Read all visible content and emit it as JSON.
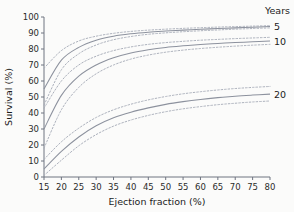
{
  "chart_data": {
    "type": "line",
    "title": "",
    "xlabel": "Ejection fraction (%)",
    "ylabel": "Survival (%)",
    "xlim": [
      15,
      80
    ],
    "ylim": [
      0,
      100
    ],
    "grid": false,
    "legend_position": "right",
    "legend_title": "Years",
    "xticks": [
      15,
      20,
      25,
      30,
      35,
      40,
      45,
      50,
      55,
      60,
      65,
      70,
      75,
      80
    ],
    "yticks": [
      0,
      10,
      20,
      30,
      40,
      50,
      60,
      70,
      80,
      90,
      100
    ],
    "x": [
      15,
      20,
      25,
      30,
      35,
      40,
      45,
      50,
      55,
      60,
      65,
      70,
      75,
      80
    ],
    "series": [
      {
        "name": "5",
        "label": "5",
        "style": "solid",
        "values": [
          55,
          73,
          81,
          85.5,
          88,
          89.5,
          90.5,
          91.2,
          91.8,
          92.3,
          92.8,
          93.2,
          93.6,
          94
        ],
        "ci_upper": [
          68,
          79,
          85,
          88,
          89.8,
          91,
          91.8,
          92.4,
          92.9,
          93.3,
          93.7,
          94,
          94.3,
          94.6
        ],
        "ci_lower": [
          45,
          67,
          77,
          82.5,
          85.8,
          87.8,
          89.2,
          90.1,
          90.8,
          91.4,
          91.9,
          92.4,
          92.8,
          93.2
        ]
      },
      {
        "name": "10",
        "label": "10",
        "style": "solid",
        "values": [
          30,
          51,
          63,
          70,
          74.5,
          77.5,
          79.5,
          81,
          82,
          82.8,
          83.5,
          84,
          84.5,
          85
        ],
        "ci_upper": [
          43,
          60,
          70,
          75.5,
          79,
          81.3,
          82.9,
          84,
          84.8,
          85.5,
          86,
          86.5,
          86.9,
          87.3
        ],
        "ci_lower": [
          18,
          42,
          56,
          64.5,
          70,
          73.7,
          76.2,
          78,
          79.3,
          80.3,
          81.1,
          81.8,
          82.4,
          82.9
        ]
      },
      {
        "name": "20",
        "label": "20",
        "style": "solid",
        "values": [
          5,
          16,
          25,
          32,
          37,
          40.5,
          43.2,
          45.4,
          47.1,
          48.5,
          49.6,
          50.5,
          51.2,
          51.8
        ],
        "ci_upper": [
          11,
          22,
          30.5,
          37.2,
          42,
          45.5,
          48.2,
          50.3,
          52,
          53.3,
          54.4,
          55.3,
          56,
          56.6
        ],
        "ci_lower": [
          1,
          10.5,
          19.5,
          26.5,
          31.8,
          35.6,
          38.5,
          40.8,
          42.6,
          44,
          45.2,
          46.1,
          46.9,
          47.5
        ]
      }
    ]
  },
  "axes": {
    "x_title": "Ejection fraction (%)",
    "y_title": "Survival (%)",
    "x_tick_labels": [
      "15",
      "20",
      "25",
      "30",
      "35",
      "40",
      "45",
      "50",
      "55",
      "60",
      "65",
      "70",
      "75",
      "80"
    ],
    "y_tick_labels": [
      "0",
      "10",
      "20",
      "30",
      "40",
      "50",
      "60",
      "70",
      "80",
      "90",
      "100"
    ]
  },
  "legend": {
    "title": "Years",
    "entries": [
      {
        "label": "5"
      },
      {
        "label": "10"
      },
      {
        "label": "20"
      }
    ]
  },
  "colors": {
    "line": "#8d929e",
    "ci": "#a8adb8",
    "axis": "#6f7480",
    "text": "#1c1c1c",
    "background": "#fbfbfa"
  }
}
